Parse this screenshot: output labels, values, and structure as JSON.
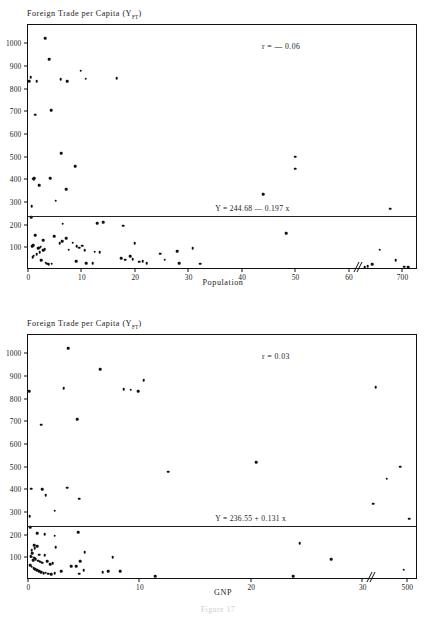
{
  "figure": {
    "caption": "Figure 17"
  },
  "chart_data": [
    {
      "type": "scatter",
      "id": "foreign-trade-vs-population",
      "title": "Foreign Trade per Capita (Y",
      "title_subscript": "FT",
      "title_suffix": ")",
      "ylabel": "Foreign Trade per Capita (Y_FT)",
      "xlabel": "Population",
      "ylim": [
        0,
        1080
      ],
      "xlim": [
        0,
        73
      ],
      "grid": false,
      "legend": "none",
      "annotations": {
        "correlation": "r = — 0.06",
        "regression_equation": "Y = 244.68 — 0.197 x"
      },
      "regression": {
        "intercept": 244.68,
        "slope": -0.197,
        "r": -0.06
      },
      "axis_break": {
        "present": true,
        "after_tick": "60",
        "symbol": "double-slash"
      },
      "yticks": [
        100,
        200,
        300,
        400,
        500,
        600,
        700,
        800,
        900,
        1000
      ],
      "ytick_labels": [
        "100",
        "200",
        "300",
        "400",
        "500",
        "600",
        "700",
        "800",
        "900",
        "1000"
      ],
      "xticks": [
        0,
        10,
        20,
        30,
        40,
        50,
        60,
        70
      ],
      "xtick_labels": [
        "0",
        "10",
        "20",
        "30",
        "40",
        "50",
        "60",
        "700"
      ],
      "points": [
        [
          0.2,
          832
        ],
        [
          0.5,
          851
        ],
        [
          1.6,
          831
        ],
        [
          3.2,
          1022
        ],
        [
          4.0,
          929
        ],
        [
          6.1,
          841
        ],
        [
          7.3,
          832
        ],
        [
          9.9,
          879
        ],
        [
          10.8,
          843
        ],
        [
          16.6,
          846
        ],
        [
          1.4,
          685
        ],
        [
          4.3,
          705
        ],
        [
          6.2,
          514
        ],
        [
          8.8,
          457
        ],
        [
          1.0,
          402
        ],
        [
          1.05,
          398
        ],
        [
          1.2,
          405
        ],
        [
          4.2,
          404
        ],
        [
          2.1,
          375
        ],
        [
          7.1,
          357
        ],
        [
          5.2,
          305
        ],
        [
          0.7,
          281
        ],
        [
          0.6,
          232
        ],
        [
          44.0,
          333
        ],
        [
          50.0,
          499
        ],
        [
          50.0,
          447
        ],
        [
          67.8,
          270
        ],
        [
          48.3,
          163
        ],
        [
          6.5,
          205
        ],
        [
          12.9,
          207
        ],
        [
          14.1,
          212
        ],
        [
          17.8,
          196
        ],
        [
          1.3,
          153
        ],
        [
          4.9,
          148
        ],
        [
          6.4,
          126
        ],
        [
          7.1,
          139
        ],
        [
          5.9,
          119
        ],
        [
          2.9,
          131
        ],
        [
          1.0,
          110
        ],
        [
          0.8,
          106
        ],
        [
          1.9,
          95
        ],
        [
          2.1,
          99
        ],
        [
          2.4,
          102
        ],
        [
          2.8,
          88
        ],
        [
          3.1,
          91
        ],
        [
          2.2,
          78
        ],
        [
          1.6,
          70
        ],
        [
          1.1,
          63
        ],
        [
          0.9,
          57
        ],
        [
          2.5,
          44
        ],
        [
          3.3,
          32
        ],
        [
          3.6,
          28
        ],
        [
          3.9,
          25
        ],
        [
          4.4,
          27
        ],
        [
          7.6,
          90
        ],
        [
          8.4,
          120
        ],
        [
          9.1,
          104
        ],
        [
          9.6,
          98
        ],
        [
          10.2,
          108
        ],
        [
          10.6,
          86
        ],
        [
          9.0,
          40
        ],
        [
          10.9,
          30
        ],
        [
          12.1,
          31
        ],
        [
          13.4,
          78
        ],
        [
          12.5,
          80
        ],
        [
          17.5,
          52
        ],
        [
          18.2,
          46
        ],
        [
          19.1,
          60
        ],
        [
          20.0,
          119
        ],
        [
          19.6,
          47
        ],
        [
          20.8,
          36
        ],
        [
          21.5,
          40
        ],
        [
          22.2,
          29
        ],
        [
          24.8,
          71
        ],
        [
          25.6,
          45
        ],
        [
          27.9,
          82
        ],
        [
          28.3,
          31
        ],
        [
          30.8,
          97
        ],
        [
          32.2,
          28
        ],
        [
          63.0,
          12
        ],
        [
          63.6,
          18
        ],
        [
          64.4,
          26
        ],
        [
          65.8,
          90
        ],
        [
          68.8,
          44
        ],
        [
          70.4,
          14
        ],
        [
          71.2,
          12
        ]
      ]
    },
    {
      "type": "scatter",
      "id": "foreign-trade-vs-gnp",
      "title": "Foreign Trade per Capita (Y",
      "title_subscript": "FT",
      "title_suffix": ")",
      "ylabel": "Foreign Trade per Capita (Y_FT)",
      "xlabel": "GNP",
      "ylim": [
        0,
        1080
      ],
      "xlim": [
        0,
        35
      ],
      "grid": false,
      "legend": "none",
      "annotations": {
        "correlation": "r = 0.03",
        "regression_equation": "Y = 236.55 + 0.131 x"
      },
      "regression": {
        "intercept": 236.55,
        "slope": 0.131,
        "r": 0.03
      },
      "axis_break": {
        "present": true,
        "after_tick": "30",
        "symbol": "double-slash"
      },
      "yticks": [
        100,
        200,
        300,
        400,
        500,
        600,
        700,
        800,
        900,
        1000
      ],
      "ytick_labels": [
        "100",
        "200",
        "300",
        "400",
        "500",
        "600",
        "700",
        "800",
        "900",
        "1000"
      ],
      "xticks": [
        0,
        10,
        20,
        30,
        34
      ],
      "xtick_labels": [
        "0",
        "10",
        "20",
        "30",
        "500"
      ],
      "points": [
        [
          0.1,
          832
        ],
        [
          3.6,
          1022
        ],
        [
          6.5,
          929
        ],
        [
          10.4,
          882
        ],
        [
          8.6,
          841
        ],
        [
          9.2,
          838
        ],
        [
          9.9,
          831
        ],
        [
          3.2,
          846
        ],
        [
          31.2,
          849
        ],
        [
          1.2,
          685
        ],
        [
          4.4,
          708
        ],
        [
          20.5,
          518
        ],
        [
          12.6,
          477
        ],
        [
          33.4,
          500
        ],
        [
          32.2,
          447
        ],
        [
          31.0,
          337
        ],
        [
          34.2,
          271
        ],
        [
          0.3,
          402
        ],
        [
          1.3,
          400
        ],
        [
          3.5,
          406
        ],
        [
          1.6,
          375
        ],
        [
          4.6,
          358
        ],
        [
          2.4,
          305
        ],
        [
          0.15,
          281
        ],
        [
          0.2,
          232
        ],
        [
          0.8,
          207
        ],
        [
          1.5,
          203
        ],
        [
          2.4,
          196
        ],
        [
          4.5,
          212
        ],
        [
          0.55,
          153
        ],
        [
          0.8,
          148
        ],
        [
          0.6,
          141
        ],
        [
          2.5,
          144
        ],
        [
          0.35,
          131
        ],
        [
          0.4,
          118
        ],
        [
          1.0,
          112
        ],
        [
          1.5,
          110
        ],
        [
          0.25,
          105
        ],
        [
          0.3,
          102
        ],
        [
          0.5,
          98
        ],
        [
          0.6,
          96
        ],
        [
          0.7,
          92
        ],
        [
          0.45,
          88
        ],
        [
          0.9,
          85
        ],
        [
          1.1,
          80
        ],
        [
          1.3,
          76
        ],
        [
          1.7,
          82
        ],
        [
          2.0,
          70
        ],
        [
          2.2,
          74
        ],
        [
          0.2,
          65
        ],
        [
          0.35,
          58
        ],
        [
          0.5,
          52
        ],
        [
          0.65,
          47
        ],
        [
          0.85,
          42
        ],
        [
          1.0,
          38
        ],
        [
          1.2,
          34
        ],
        [
          1.4,
          30
        ],
        [
          1.6,
          33
        ],
        [
          1.8,
          28
        ],
        [
          2.1,
          26
        ],
        [
          2.4,
          30
        ],
        [
          3.0,
          38
        ],
        [
          5.1,
          122
        ],
        [
          7.6,
          100
        ],
        [
          4.7,
          84
        ],
        [
          3.9,
          60
        ],
        [
          4.3,
          62
        ],
        [
          4.6,
          28
        ],
        [
          5.0,
          42
        ],
        [
          6.7,
          35
        ],
        [
          7.2,
          40
        ],
        [
          8.3,
          38
        ],
        [
          11.4,
          18
        ],
        [
          23.8,
          16
        ],
        [
          24.4,
          161
        ],
        [
          27.2,
          92
        ],
        [
          33.7,
          45
        ]
      ]
    }
  ]
}
